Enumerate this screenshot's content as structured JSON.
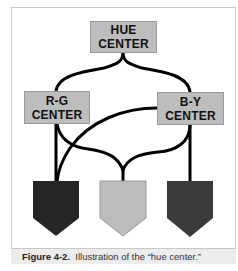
{
  "diagram": {
    "nodes": {
      "hue": {
        "line1": "HUE",
        "line2": "CENTER",
        "fill": "#bdbdbd"
      },
      "rg": {
        "line1": "R-G",
        "line2": "CENTER",
        "fill": "#bdbdbd"
      },
      "by": {
        "line1": "B-Y",
        "line2": "CENTER",
        "fill": "#bdbdbd"
      }
    },
    "outputs": [
      {
        "name": "left-output",
        "fill": "#262626"
      },
      {
        "name": "middle-output",
        "fill": "#bcbcbc"
      },
      {
        "name": "right-output",
        "fill": "#3a3a3a"
      }
    ],
    "edges": [
      "HUE CENTER - R-G CENTER",
      "HUE CENTER - B-Y CENTER",
      "R-G CENTER - left output",
      "R-G CENTER - middle output",
      "B-Y CENTER - left output",
      "B-Y CENTER - middle output",
      "B-Y CENTER - right output"
    ]
  },
  "caption": {
    "label": "Figure 4-2.",
    "text": "Illustration of the “hue center.”"
  }
}
